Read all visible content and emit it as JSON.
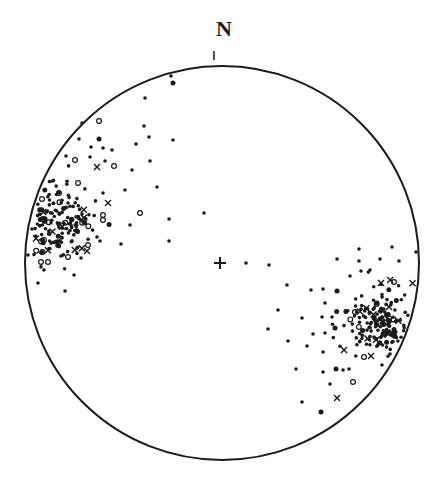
{
  "diagram": {
    "type": "stereonet",
    "north_label": "N",
    "ink_color": "#1a1a1a",
    "background": "#ffffff",
    "primitive_circle": {
      "cx": 222,
      "cy": 263,
      "r": 197
    },
    "center_mark": {
      "x": 220,
      "y": 263,
      "symbol": "plus"
    },
    "north_tick": {
      "x": 214,
      "y1": 51,
      "y2": 60
    }
  },
  "chart_data": {
    "type": "scatter",
    "title": "",
    "annotations": [
      "N"
    ],
    "legend": [],
    "symbols": {
      "dot": "filled circle",
      "big": "large filled circle",
      "ring": "open circle",
      "cross": "x mark"
    },
    "points": [
      {
        "x": 171,
        "y": 76,
        "s": "dot"
      },
      {
        "x": 173,
        "y": 83,
        "s": "big"
      },
      {
        "x": 145,
        "y": 98,
        "s": "dot"
      },
      {
        "x": 99,
        "y": 121,
        "s": "ring"
      },
      {
        "x": 82,
        "y": 123,
        "s": "dot"
      },
      {
        "x": 144,
        "y": 126,
        "s": "dot"
      },
      {
        "x": 149,
        "y": 137,
        "s": "dot"
      },
      {
        "x": 173,
        "y": 140,
        "s": "dot"
      },
      {
        "x": 79,
        "y": 139,
        "s": "dot"
      },
      {
        "x": 99,
        "y": 139,
        "s": "big"
      },
      {
        "x": 91,
        "y": 147,
        "s": "dot"
      },
      {
        "x": 103,
        "y": 148,
        "s": "dot"
      },
      {
        "x": 112,
        "y": 150,
        "s": "dot"
      },
      {
        "x": 136,
        "y": 144,
        "s": "dot"
      },
      {
        "x": 66,
        "y": 156,
        "s": "dot"
      },
      {
        "x": 75,
        "y": 160,
        "s": "ring"
      },
      {
        "x": 90,
        "y": 157,
        "s": "dot"
      },
      {
        "x": 105,
        "y": 161,
        "s": "dot"
      },
      {
        "x": 114,
        "y": 166,
        "s": "ring"
      },
      {
        "x": 97,
        "y": 167,
        "s": "cross"
      },
      {
        "x": 150,
        "y": 161,
        "s": "dot"
      },
      {
        "x": 132,
        "y": 170,
        "s": "dot"
      },
      {
        "x": 157,
        "y": 187,
        "s": "dot"
      },
      {
        "x": 125,
        "y": 190,
        "s": "dot"
      },
      {
        "x": 140,
        "y": 213,
        "s": "ring"
      },
      {
        "x": 169,
        "y": 219,
        "s": "dot"
      },
      {
        "x": 204,
        "y": 213,
        "s": "dot"
      },
      {
        "x": 130,
        "y": 225,
        "s": "dot"
      },
      {
        "x": 169,
        "y": 241,
        "s": "dot"
      },
      {
        "x": 121,
        "y": 244,
        "s": "dot"
      },
      {
        "x": 100,
        "y": 241,
        "s": "dot"
      },
      {
        "x": 108,
        "y": 203,
        "s": "cross"
      },
      {
        "x": 87,
        "y": 251,
        "s": "cross"
      },
      {
        "x": 82,
        "y": 214,
        "s": "dot"
      },
      {
        "x": 103,
        "y": 193,
        "s": "dot"
      },
      {
        "x": 103,
        "y": 215,
        "s": "ring"
      },
      {
        "x": 103,
        "y": 220,
        "s": "ring"
      },
      {
        "x": 88,
        "y": 245,
        "s": "ring"
      },
      {
        "x": 68,
        "y": 257,
        "s": "ring"
      },
      {
        "x": 48,
        "y": 262,
        "s": "ring"
      },
      {
        "x": 41,
        "y": 262,
        "s": "ring"
      },
      {
        "x": 61,
        "y": 256,
        "s": "dot"
      },
      {
        "x": 44,
        "y": 270,
        "s": "dot"
      },
      {
        "x": 74,
        "y": 275,
        "s": "dot"
      },
      {
        "x": 38,
        "y": 283,
        "s": "dot"
      },
      {
        "x": 65,
        "y": 291,
        "s": "dot"
      },
      {
        "x": 81,
        "y": 258,
        "s": "dot"
      },
      {
        "x": 77,
        "y": 248,
        "s": "dot"
      },
      {
        "x": 62,
        "y": 238,
        "s": "dot"
      },
      {
        "x": 57,
        "y": 246,
        "s": "dot"
      },
      {
        "x": 97,
        "y": 237,
        "s": "dot"
      },
      {
        "x": 28,
        "y": 255,
        "s": "dot"
      },
      {
        "x": 78,
        "y": 183,
        "s": "ring"
      },
      {
        "x": 59,
        "y": 193,
        "s": "ring"
      },
      {
        "x": 42,
        "y": 199,
        "s": "ring"
      },
      {
        "x": 68,
        "y": 203,
        "s": "dot"
      },
      {
        "x": 246,
        "y": 263,
        "s": "dot"
      },
      {
        "x": 269,
        "y": 265,
        "s": "dot"
      },
      {
        "x": 359,
        "y": 249,
        "s": "dot"
      },
      {
        "x": 392,
        "y": 247,
        "s": "dot"
      },
      {
        "x": 416,
        "y": 252,
        "s": "dot"
      },
      {
        "x": 337,
        "y": 259,
        "s": "dot"
      },
      {
        "x": 359,
        "y": 261,
        "s": "dot"
      },
      {
        "x": 380,
        "y": 259,
        "s": "dot"
      },
      {
        "x": 399,
        "y": 261,
        "s": "dot"
      },
      {
        "x": 350,
        "y": 276,
        "s": "dot"
      },
      {
        "x": 370,
        "y": 270,
        "s": "dot"
      },
      {
        "x": 361,
        "y": 271,
        "s": "dot"
      },
      {
        "x": 287,
        "y": 285,
        "s": "dot"
      },
      {
        "x": 311,
        "y": 290,
        "s": "dot"
      },
      {
        "x": 323,
        "y": 289,
        "s": "dot"
      },
      {
        "x": 337,
        "y": 291,
        "s": "big"
      },
      {
        "x": 325,
        "y": 303,
        "s": "dot"
      },
      {
        "x": 278,
        "y": 310,
        "s": "dot"
      },
      {
        "x": 302,
        "y": 318,
        "s": "dot"
      },
      {
        "x": 322,
        "y": 317,
        "s": "dot"
      },
      {
        "x": 332,
        "y": 317,
        "s": "dot"
      },
      {
        "x": 335,
        "y": 328,
        "s": "big"
      },
      {
        "x": 268,
        "y": 329,
        "s": "dot"
      },
      {
        "x": 313,
        "y": 334,
        "s": "dot"
      },
      {
        "x": 325,
        "y": 333,
        "s": "dot"
      },
      {
        "x": 288,
        "y": 341,
        "s": "dot"
      },
      {
        "x": 307,
        "y": 346,
        "s": "dot"
      },
      {
        "x": 323,
        "y": 352,
        "s": "dot"
      },
      {
        "x": 296,
        "y": 369,
        "s": "dot"
      },
      {
        "x": 323,
        "y": 372,
        "s": "dot"
      },
      {
        "x": 336,
        "y": 369,
        "s": "big"
      },
      {
        "x": 330,
        "y": 384,
        "s": "dot"
      },
      {
        "x": 353,
        "y": 382,
        "s": "ring"
      },
      {
        "x": 337,
        "y": 398,
        "s": "cross"
      },
      {
        "x": 302,
        "y": 402,
        "s": "dot"
      },
      {
        "x": 321,
        "y": 412,
        "s": "big"
      },
      {
        "x": 381,
        "y": 283,
        "s": "cross"
      },
      {
        "x": 394,
        "y": 282,
        "s": "ring"
      },
      {
        "x": 344,
        "y": 350,
        "s": "cross"
      },
      {
        "x": 371,
        "y": 356,
        "s": "cross"
      },
      {
        "x": 364,
        "y": 357,
        "s": "ring"
      },
      {
        "x": 389,
        "y": 307,
        "s": "cross"
      },
      {
        "x": 343,
        "y": 370,
        "s": "dot"
      },
      {
        "x": 349,
        "y": 369,
        "s": "dot"
      },
      {
        "x": 382,
        "y": 365,
        "s": "dot"
      },
      {
        "x": 390,
        "y": 354,
        "s": "dot"
      }
    ],
    "clusters": [
      {
        "name": "NW cluster",
        "cx": 58,
        "cy": 218,
        "rx": 30,
        "ry": 34,
        "count": 170,
        "seed": 7
      },
      {
        "name": "SE cluster",
        "cx": 376,
        "cy": 322,
        "rx": 32,
        "ry": 30,
        "count": 170,
        "seed": 13
      }
    ]
  }
}
